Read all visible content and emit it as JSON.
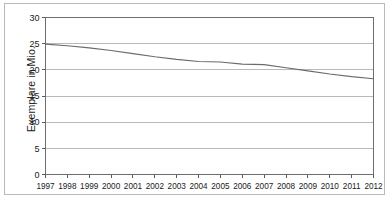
{
  "chart_data": {
    "type": "line",
    "title": "",
    "subtitle": "",
    "xlabel": "",
    "ylabel": "Exemplare in Mio.",
    "grid": true,
    "legend": false,
    "legend_position": "none",
    "xlim": [
      1997,
      2012
    ],
    "ylim": [
      0,
      30
    ],
    "y_ticks": [
      0,
      5,
      10,
      15,
      20,
      25,
      30
    ],
    "y_tick_labels": [
      "0",
      "5",
      "10",
      "15",
      "20",
      "25",
      "30"
    ],
    "x": [
      1997,
      1998,
      1999,
      2000,
      2001,
      2002,
      2003,
      2004,
      2005,
      2006,
      2007,
      2008,
      2009,
      2010,
      2011,
      2012
    ],
    "categories": [
      "1997",
      "1998",
      "1999",
      "2000",
      "2001",
      "2002",
      "2003",
      "2004",
      "2005",
      "2006",
      "2007",
      "2008",
      "2009",
      "2010",
      "2011",
      "2012"
    ],
    "series": [
      {
        "name": "Exemplare",
        "color": "#6b6b6b",
        "values": [
          24.9,
          24.6,
          24.2,
          23.7,
          23.1,
          22.5,
          22.0,
          21.6,
          21.5,
          21.1,
          21.0,
          20.4,
          19.8,
          19.2,
          18.7,
          18.3
        ]
      }
    ],
    "line_color": "#6b6b6b",
    "gridline_color": "#a8a8a8",
    "axis_color": "#5a5a5a",
    "background_color": "#ffffff"
  }
}
